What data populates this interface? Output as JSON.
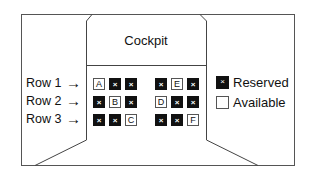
{
  "title": "Cockpit",
  "rows": [
    {
      "label": "Row 1",
      "arrow": "→",
      "seats": [
        {
          "id": "A",
          "status": "available"
        },
        {
          "id": "",
          "status": "reserved"
        },
        {
          "id": "",
          "status": "reserved"
        },
        {
          "id": "",
          "status": "reserved"
        },
        {
          "id": "E",
          "status": "available"
        },
        {
          "id": "",
          "status": "reserved"
        }
      ]
    },
    {
      "label": "Row 2",
      "arrow": "→",
      "seats": [
        {
          "id": "",
          "status": "reserved"
        },
        {
          "id": "B",
          "status": "available"
        },
        {
          "id": "",
          "status": "reserved"
        },
        {
          "id": "D",
          "status": "available"
        },
        {
          "id": "",
          "status": "reserved"
        },
        {
          "id": "",
          "status": "reserved"
        }
      ]
    },
    {
      "label": "Row 3",
      "arrow": "→",
      "seats": [
        {
          "id": "",
          "status": "reserved"
        },
        {
          "id": "",
          "status": "reserved"
        },
        {
          "id": "C",
          "status": "available"
        },
        {
          "id": "",
          "status": "reserved"
        },
        {
          "id": "",
          "status": "reserved"
        },
        {
          "id": "F",
          "status": "available"
        }
      ]
    }
  ],
  "reserved_mark": "×",
  "legend": {
    "reserved": {
      "label": "Reserved",
      "mark": "×",
      "color": "#111111"
    },
    "available": {
      "label": "Available",
      "mark": "",
      "color": "#ffffff"
    }
  }
}
